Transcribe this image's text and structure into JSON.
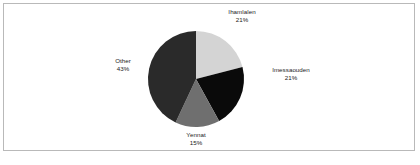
{
  "figure": {
    "background_color": "#ffffff",
    "border_color": "#b9b9b9"
  },
  "chart_data": {
    "type": "pie",
    "title": "",
    "subtitle": "",
    "xlabel": "",
    "ylabel": "",
    "legend_position": "none",
    "grid": false,
    "start_angle_deg": 0,
    "direction": "clockwise",
    "categories": [
      "Ihamlalen",
      "Imessaouden",
      "Yennat",
      "Other"
    ],
    "values": [
      21,
      21,
      15,
      43
    ],
    "value_unit": "%",
    "colors": [
      "#d4d4d4",
      "#0a0a0a",
      "#6f6f6f",
      "#2a2a2a"
    ],
    "slices": [
      {
        "label": "Ihamlalen",
        "value": 21,
        "value_text": "21%",
        "color": "#d4d4d4",
        "label_position": "top-right"
      },
      {
        "label": "Imessaouden",
        "value": 21,
        "value_text": "21%",
        "color": "#0a0a0a",
        "label_position": "right"
      },
      {
        "label": "Yennat",
        "value": 15,
        "value_text": "15%",
        "color": "#6f6f6f",
        "label_position": "bottom"
      },
      {
        "label": "Other",
        "value": 43,
        "value_text": "43%",
        "color": "#2a2a2a",
        "label_position": "left"
      }
    ]
  },
  "bottom_artifact": {
    "text": ""
  }
}
